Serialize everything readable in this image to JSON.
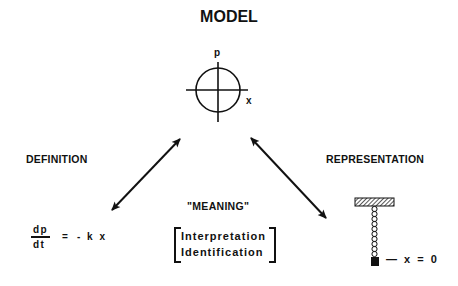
{
  "title": "MODEL",
  "phase_plot": {
    "vertical_axis_label": "p",
    "horizontal_axis_label": "x"
  },
  "left_node": {
    "label": "DEFINITION",
    "equation": {
      "numerator": "dp",
      "denominator": "dt",
      "equals": "=",
      "rhs": "- k x"
    }
  },
  "right_node": {
    "label": "REPRESENTATION",
    "equilibrium_label": "— x = 0"
  },
  "center_node": {
    "label": "\"MEANING\"",
    "items": [
      "Interpretation",
      "Identification"
    ]
  },
  "arrows": [
    {
      "from": "MODEL",
      "to": "DEFINITION",
      "style": "double-headed"
    },
    {
      "from": "MODEL",
      "to": "REPRESENTATION",
      "style": "double-headed"
    }
  ]
}
